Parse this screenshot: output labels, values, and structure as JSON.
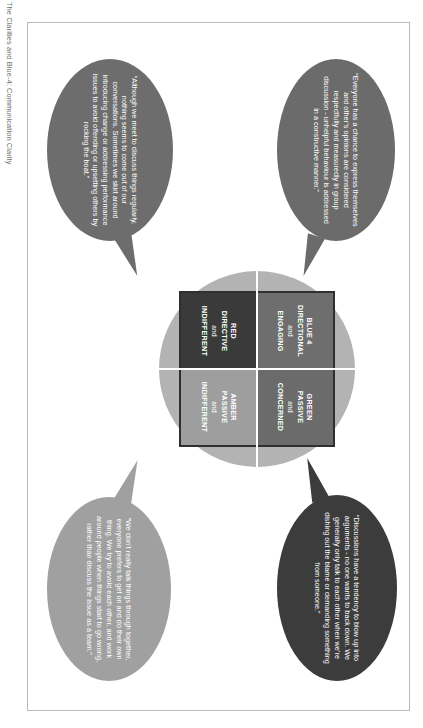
{
  "page": {
    "title": "The Clarities and Blue-4: Communication Clarity"
  },
  "model": {
    "quadrants": [
      {
        "id": "blue-4",
        "color_name": "BLUE 4",
        "line1": "BLUE 4",
        "line2": "DIRECTIONAL",
        "connector": "and",
        "line3": "ENGAGING",
        "fill": "#6e6e6e",
        "position": "top-left"
      },
      {
        "id": "green",
        "color_name": "GREEN",
        "line1": "GREEN",
        "line2": "PASSIVE",
        "connector": "and",
        "line3": "CONCERNED",
        "fill": "#6b6b6b",
        "position": "top-right"
      },
      {
        "id": "red",
        "color_name": "RED",
        "line1": "RED",
        "line2": "DIRECTIVE",
        "connector": "and",
        "line3": "INDIFFERENT",
        "fill": "#3a3a3a",
        "position": "bottom-left"
      },
      {
        "id": "amber",
        "color_name": "AMBER",
        "line1": "AMBER",
        "line2": "PASSIVE",
        "connector": "and",
        "line3": "INDIFFERENT",
        "fill": "#9e9e9e",
        "position": "bottom-right"
      }
    ],
    "halo_color": "#b3b3b3",
    "grid_border_color": "#2f2f2f"
  },
  "bubbles": {
    "blue": {
      "id": "bubble-blue-4",
      "quote": "“Everyone has a chance to express themselves and other’s opinions are considered respectfully and measuredly in group discussion - unhelpful behaviour is addressed in a constructive manner.”",
      "fill": "#6b6b6b"
    },
    "green": {
      "id": "bubble-green",
      "quote": "“Although we meet to discuss things regularly, nothing seems to come out of our conversations. Sometimes we skirt around introducing change or addressing performance issues to avoid offending or upsetting others by rocking the boat.”",
      "fill": "#6d6d6d"
    },
    "red": {
      "id": "bubble-red",
      "quote": "“Discussions have a tendency to blow up into arguments - no one wants to back down. We generally only talk to each other when we’re dishing out the blame or demanding something from someone.”",
      "fill": "#3c3c3c"
    },
    "amber": {
      "id": "bubble-amber",
      "quote": "“We don’t really talk things through together, everyone prefers to get on and do their own thing. We try to avoid each other, and work around people when things start to go wrong, rather than discuss the issue as a team.”",
      "fill": "#a0a0a0"
    }
  }
}
